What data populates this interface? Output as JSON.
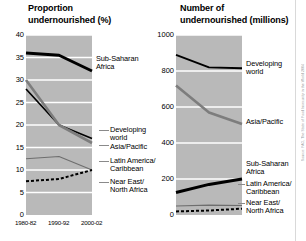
{
  "figure": {
    "background": "#ffffff",
    "plot_background": "#b9b9b9",
    "gridline_color": "#ffffff",
    "credit_text": "Source: FAO, The State of Food Insecurity in the World 2004"
  },
  "chart_data": [
    {
      "id": "proportion",
      "type": "line",
      "title": "Proportion\nundernourished (%)",
      "xlabel": "",
      "ylabel": "",
      "x": [
        "1980-82",
        "1990-92",
        "2000-02"
      ],
      "categories": [
        "1980-82",
        "1990-92",
        "2000-02"
      ],
      "yticks": [
        0,
        5,
        10,
        15,
        20,
        25,
        30,
        35,
        40
      ],
      "ylim": [
        0,
        40
      ],
      "grid": true,
      "legend_position": "right-inline-callouts",
      "series": [
        {
          "name": "Sub-Saharan Africa",
          "label": "Sub-Saharan\nAfrica",
          "values": [
            36,
            35.5,
            32
          ],
          "color": "#000000",
          "width": 3.0,
          "dash": "none"
        },
        {
          "name": "Developing world",
          "label": "Developing\nworld",
          "values": [
            28,
            20,
            17
          ],
          "color": "#000000",
          "width": 1.7,
          "dash": "none"
        },
        {
          "name": "Asia/Pacific",
          "label": "Asia/Pacific",
          "values": [
            30,
            20,
            16
          ],
          "color": "#7d7d7d",
          "width": 2.6,
          "dash": "none"
        },
        {
          "name": "Latin America/Caribbean",
          "label": "Latin America/\nCaribbean",
          "values": [
            12.5,
            13,
            10
          ],
          "color": "#6e6e6e",
          "width": 1.1,
          "dash": "none"
        },
        {
          "name": "Near East/North Africa",
          "label": "Near East/\nNorth Africa",
          "values": [
            7.5,
            8,
            10
          ],
          "color": "#000000",
          "width": 2.0,
          "dash": "3 2"
        }
      ]
    },
    {
      "id": "number",
      "type": "line",
      "title": "Number of\nundernourished (millions)",
      "xlabel": "",
      "ylabel": "",
      "x": [
        "1980-82",
        "1990-92",
        "2000-02"
      ],
      "categories": [
        "1980-82",
        "1990-92",
        "2000-02"
      ],
      "yticks": [
        0,
        200,
        400,
        600,
        800,
        1000
      ],
      "ylim": [
        0,
        1000
      ],
      "grid": true,
      "legend_position": "right-inline-callouts",
      "series": [
        {
          "name": "Developing world",
          "label": "Developing\nworld",
          "values": [
            890,
            820,
            815
          ],
          "color": "#000000",
          "width": 1.9,
          "dash": "none"
        },
        {
          "name": "Asia/Pacific",
          "label": "Asia/Pacific",
          "values": [
            720,
            570,
            505
          ],
          "color": "#7d7d7d",
          "width": 2.6,
          "dash": "none"
        },
        {
          "name": "Sub-Saharan Africa",
          "label": "Sub-Saharan\nAfrica",
          "values": [
            125,
            170,
            200
          ],
          "color": "#000000",
          "width": 3.0,
          "dash": "none"
        },
        {
          "name": "Latin America/Caribbean",
          "label": "Latin America/\nCaribbean",
          "values": [
            50,
            55,
            53
          ],
          "color": "#6e6e6e",
          "width": 1.1,
          "dash": "none"
        },
        {
          "name": "Near East/North Africa",
          "label": "Near East/\nNorth Africa",
          "values": [
            20,
            25,
            35
          ],
          "color": "#000000",
          "width": 2.0,
          "dash": "3 2"
        }
      ]
    }
  ]
}
